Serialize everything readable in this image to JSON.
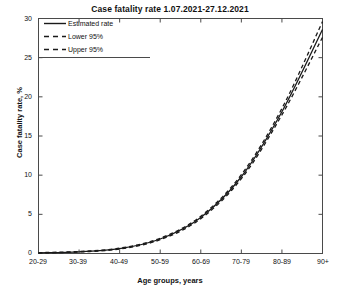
{
  "chart_data": {
    "type": "line",
    "title": "Case fatality rate 1.07.2021-27.12.2021",
    "xlabel": "Age groups, years",
    "ylabel": "Case fatality rate, %",
    "categories": [
      "20-29",
      "30-39",
      "40-49",
      "50-59",
      "60-69",
      "70-79",
      "80-89",
      "90+"
    ],
    "xlim": [
      0,
      7
    ],
    "ylim": [
      0,
      30
    ],
    "yticks": [
      0,
      5,
      10,
      15,
      20,
      25,
      30
    ],
    "grid": false,
    "legend_position": "top-left",
    "series": [
      {
        "name": "Estimated rate",
        "style": "solid",
        "values": [
          0.08,
          0.22,
          0.62,
          1.85,
          4.6,
          9.8,
          18.1,
          28.6
        ]
      },
      {
        "name": "Lower 95%",
        "style": "dashed",
        "values": [
          0.06,
          0.19,
          0.57,
          1.76,
          4.45,
          9.55,
          17.7,
          27.6
        ]
      },
      {
        "name": "Upper 95%",
        "style": "dashed",
        "values": [
          0.11,
          0.26,
          0.68,
          1.95,
          4.76,
          10.06,
          18.52,
          29.6
        ]
      }
    ],
    "colors": {
      "line": "#1a1a1a",
      "axis": "#4a4a4a",
      "background": "#ffffff"
    }
  },
  "legend": {
    "items": [
      {
        "label": "Estimated rate",
        "style": "solid"
      },
      {
        "label": "Lower 95%",
        "style": "dashed"
      },
      {
        "label": "Upper 95%",
        "style": "dashed"
      }
    ]
  }
}
